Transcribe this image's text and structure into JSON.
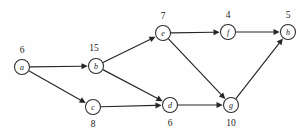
{
  "figure": {
    "background_color": "#fefefe",
    "stroke_color": "#262626",
    "node_fill_color": "#ffffff",
    "width": 306,
    "height": 134
  },
  "graph_data": {
    "type": "diagram",
    "graph_type": "directed-acyclic-graph",
    "directed": true,
    "node_count": 8,
    "edge_count": 10,
    "node_radius": 7.5,
    "nodes": [
      {
        "id": "a",
        "label": "a",
        "weight": "6",
        "x": 22,
        "y": 67,
        "weight_x": 22,
        "weight_y": 50,
        "weight_position": "above"
      },
      {
        "id": "b",
        "label": "b",
        "weight": "15",
        "x": 96,
        "y": 66,
        "weight_x": 94,
        "weight_y": 48,
        "weight_position": "above"
      },
      {
        "id": "c",
        "label": "c",
        "weight": "8",
        "x": 93,
        "y": 107,
        "weight_x": 93,
        "weight_y": 124,
        "weight_position": "below"
      },
      {
        "id": "d",
        "label": "d",
        "weight": "6",
        "x": 170,
        "y": 105,
        "weight_x": 170,
        "weight_y": 123,
        "weight_position": "below"
      },
      {
        "id": "e",
        "label": "e",
        "weight": "7",
        "x": 163,
        "y": 33,
        "weight_x": 163,
        "weight_y": 16,
        "weight_position": "above"
      },
      {
        "id": "f",
        "label": "f",
        "weight": "4",
        "x": 228,
        "y": 32,
        "weight_x": 228,
        "weight_y": 15,
        "weight_position": "above"
      },
      {
        "id": "g",
        "label": "g",
        "weight": "10",
        "x": 231,
        "y": 105,
        "weight_x": 231,
        "weight_y": 123,
        "weight_position": "below"
      },
      {
        "id": "h",
        "label": "h",
        "weight": "5",
        "x": 288,
        "y": 32,
        "weight_x": 288,
        "weight_y": 15,
        "weight_position": "above"
      }
    ],
    "edges": [
      {
        "from": "a",
        "to": "b"
      },
      {
        "from": "a",
        "to": "c"
      },
      {
        "from": "b",
        "to": "e"
      },
      {
        "from": "b",
        "to": "d"
      },
      {
        "from": "c",
        "to": "d"
      },
      {
        "from": "e",
        "to": "f"
      },
      {
        "from": "e",
        "to": "g"
      },
      {
        "from": "d",
        "to": "g"
      },
      {
        "from": "f",
        "to": "h"
      },
      {
        "from": "g",
        "to": "h"
      }
    ]
  }
}
